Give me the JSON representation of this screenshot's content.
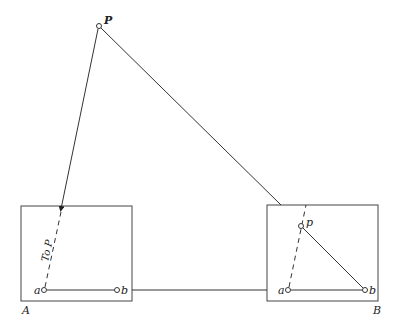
{
  "diagram": {
    "point_P": {
      "label": "P",
      "x": 99,
      "y": 26
    },
    "box_A": {
      "label": "A",
      "rect": {
        "x": 21,
        "y": 206,
        "w": 111,
        "h": 95
      },
      "point_a": {
        "label": "a",
        "x": 44,
        "y": 290
      },
      "point_b": {
        "label": "b",
        "x": 117,
        "y": 290
      },
      "ray_label": "To P"
    },
    "box_B": {
      "label": "B",
      "rect": {
        "x": 267,
        "y": 205,
        "w": 111,
        "h": 96
      },
      "point_a": {
        "label": "a",
        "x": 288,
        "y": 290
      },
      "point_b": {
        "label": "b",
        "x": 365,
        "y": 290
      },
      "point_p": {
        "label": "p",
        "x": 301,
        "y": 226
      }
    },
    "colors": {
      "line": "#333333",
      "text": "#222222",
      "background": "#ffffff"
    }
  }
}
